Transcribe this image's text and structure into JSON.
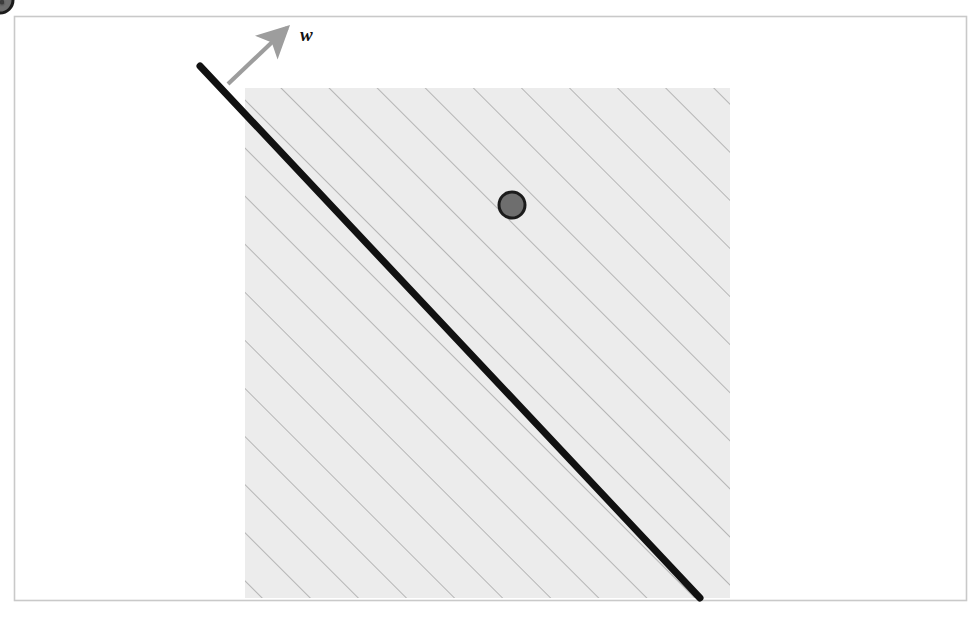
{
  "figure": {
    "frame_color": "#c9c9c9",
    "background": "#ffffff"
  },
  "region": {
    "name": "hatched-region",
    "fill": "#ececec",
    "hatch_color": "#9a9a9a",
    "x": 245,
    "y": 88,
    "width": 485,
    "height": 510
  },
  "boundary": {
    "name": "decision-boundary-line",
    "color": "#111111",
    "width": 7,
    "x1": 200,
    "y1": 66,
    "x2": 700,
    "y2": 598
  },
  "normal_vector": {
    "label": "w",
    "color": "#9d9d9d",
    "x1": 228,
    "y1": 84,
    "x2": 287,
    "y2": 28,
    "label_x": 300,
    "label_y": 24
  },
  "points": [
    {
      "id": "q1",
      "label": "q",
      "sub": "1",
      "x": 512,
      "y": 205,
      "dot_fill": "#6e6e6e",
      "dot_stroke": "#1b1b1b",
      "pin_x": 508,
      "pin_y": 96,
      "foot_x": 422,
      "foot_y": 290,
      "arrow_dir": "to-point"
    },
    {
      "id": "q2",
      "label": "q",
      "sub": "2",
      "x": 397,
      "y": 518,
      "dot_fill": "#6e6e6e",
      "dot_stroke": "#1b1b1b",
      "pin_x": 393,
      "pin_y": 409,
      "foot_x": 512,
      "foot_y": 405,
      "arrow_dir": "to-point"
    }
  ],
  "callouts": [
    {
      "id": "boundary-label",
      "equation_html": "<i class='v'>f</i>&thinsp;(<b class='bv'>x</b>) = <b class='bv'>w</b><sup class='t'>T</sup><b class='bv'>x</b> + <i class='v'>b</i> = 0",
      "equation_text": "f (x) = wTx + b = 0",
      "box": {
        "x": 18,
        "y": 177,
        "width": 200,
        "height": 37
      },
      "leader": {
        "x1": 104,
        "y1": 177,
        "x2": 241,
        "y2": 104
      }
    },
    {
      "id": "positive-side-label",
      "equation_html": "<i class='v'>f</i>&thinsp;(<b class='bv'>x</b>) = <b class='bv'>w</b><sup class='t'>T</sup><b class='bv'>x</b> + <i class='v'>b</i> &gt; 0",
      "equation_text": "f (x) = wTx + b > 0",
      "box": {
        "x": 772,
        "y": 373,
        "width": 197,
        "height": 37
      },
      "leader": {
        "x1": 772,
        "y1": 392,
        "x2": 668,
        "y2": 303
      }
    },
    {
      "id": "negative-side-label",
      "equation_html": "<i class='v'>f</i>&thinsp;(<b class='bv'>x</b>) = <b class='bv'>w</b><sup class='t'>T</sup><b class='bv'>x</b> + <i class='v'>b</i> &lt; 0",
      "equation_text": "f (x) = wTx + b < 0",
      "box": {
        "x": 16,
        "y": 533,
        "width": 197,
        "height": 37
      },
      "leader": {
        "x1": 175,
        "y1": 533,
        "x2": 316,
        "y2": 414
      }
    }
  ],
  "axes_indicator": {
    "name": "axis-indicator",
    "color": "#8d8d8d",
    "origin_x": 878,
    "origin_y": 592,
    "x_end": 948,
    "y_end": 522
  }
}
